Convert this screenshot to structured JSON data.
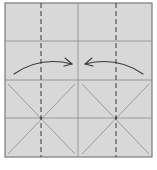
{
  "diagram": {
    "type": "origami-fold-step",
    "paper": {
      "x": 5,
      "y": 3,
      "width": 147,
      "height": 154,
      "fill": "#d8d8d8",
      "border": "#7a7a7a"
    },
    "colors": {
      "crease": "#8c8c8c",
      "valley_fold": "#4a4a4a",
      "arrow": "#3a3a3a"
    },
    "valley_folds": [
      {
        "x": 41,
        "y1": 3,
        "y2": 157
      },
      {
        "x": 116,
        "y1": 3,
        "y2": 157
      }
    ],
    "creases": {
      "vertical": [
        {
          "x": 78,
          "y1": 3,
          "y2": 157
        }
      ],
      "horizontal": [
        {
          "y": 41
        },
        {
          "y": 80
        },
        {
          "y": 118
        }
      ],
      "diagonals": [
        {
          "x1": 8,
          "y1": 84,
          "x2": 75,
          "y2": 154
        },
        {
          "x1": 75,
          "y1": 84,
          "x2": 8,
          "y2": 154
        },
        {
          "x1": 82,
          "y1": 84,
          "x2": 149,
          "y2": 154
        },
        {
          "x1": 149,
          "y1": 84,
          "x2": 82,
          "y2": 154
        }
      ]
    },
    "arrows": [
      {
        "label": "fold-left-flap-to-center",
        "path": "M14 74 Q40 56 72 64",
        "head": "M65 58 L72 64 L64 66"
      },
      {
        "label": "fold-right-flap-to-center",
        "path": "M143 74 Q117 56 85 64",
        "head": "M92 58 L85 64 L93 66"
      }
    ]
  }
}
